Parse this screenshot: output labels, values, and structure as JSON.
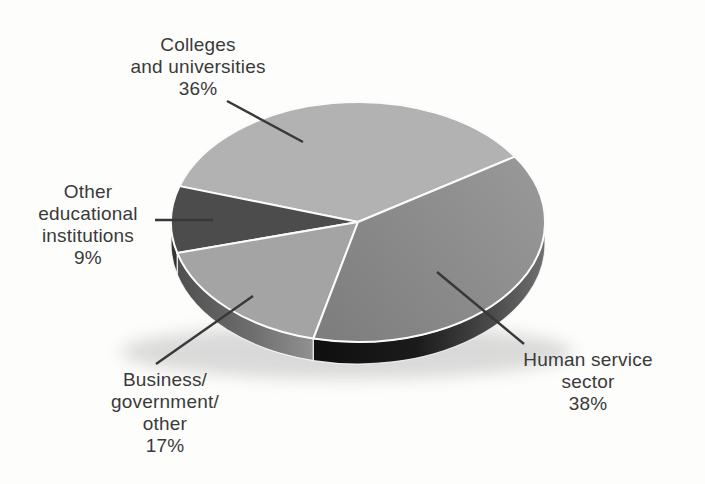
{
  "chart_data": {
    "type": "pie",
    "style": "3d",
    "title": "",
    "legend_position": "none",
    "start_angle_deg": 33,
    "direction": "counterclockwise",
    "series": [
      {
        "label": "Colleges and universities",
        "value": 36,
        "color_top": "#b2b2b2"
      },
      {
        "label": "Other educational institutions",
        "value": 9,
        "color_top": "#4c4c4c",
        "color_side": "#343434"
      },
      {
        "label": "Business/government/other",
        "value": 17,
        "color_top": "#a4a4a4",
        "color_side_stops": [
          [
            "0%",
            "#4f4f4f"
          ],
          [
            "55%",
            "#6e6e6e"
          ],
          [
            "100%",
            "#919191"
          ]
        ]
      },
      {
        "label": "Human service sector",
        "value": 38,
        "color_top": "#8b8b8b",
        "color_top_stops": [
          [
            "0%",
            "#7d7d7d"
          ],
          [
            "100%",
            "#989898"
          ]
        ],
        "color_side_stops": [
          [
            "0%",
            "#0f0f0f"
          ],
          [
            "45%",
            "#1b1b1b"
          ],
          [
            "80%",
            "#4f4f4f"
          ],
          [
            "100%",
            "#707070"
          ]
        ]
      }
    ],
    "callouts": [
      {
        "text": "Colleges\nand universities\n36%"
      },
      {
        "text": "Other\neducational\ninstitutions\n9%"
      },
      {
        "text": "Business/\ngovernment/\nother\n17%"
      },
      {
        "text": "Human service\nsector\n38%"
      }
    ]
  },
  "colors": {
    "label_text": "#3a3a3a",
    "leader_line": "#383838",
    "separator": "#fbfbfb",
    "shadow": "#bdbdbd",
    "background": "#fdfdfc"
  }
}
